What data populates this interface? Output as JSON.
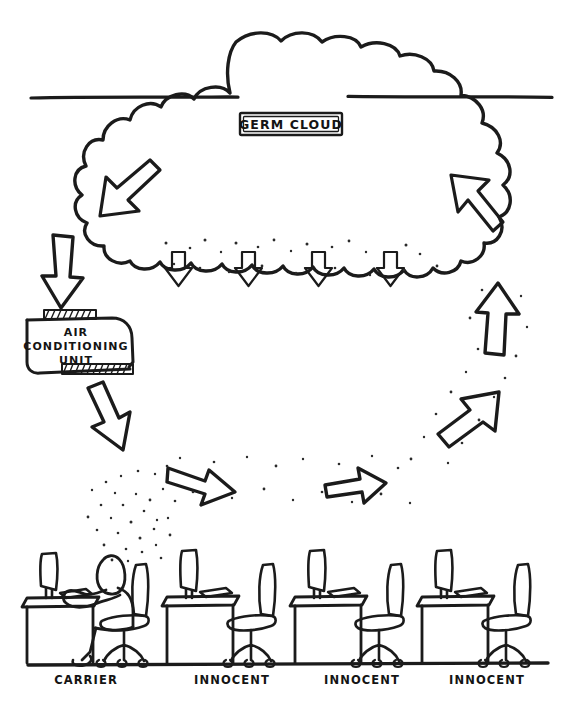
{
  "diagram": {
    "style": "hand-drawn black ink line art on white paper",
    "labels": {
      "cloud": "GERM CLOUD",
      "ac_unit_line1": "AIR",
      "ac_unit_line2": "CONDITIONING",
      "ac_unit_line3": "UNIT"
    },
    "desk_labels": [
      {
        "id": "desk-1",
        "text": "CARRIER",
        "x": 86,
        "occupied": true
      },
      {
        "id": "desk-2",
        "text": "INNOCENT",
        "x": 232,
        "occupied": false
      },
      {
        "id": "desk-3",
        "text": "INNOCENT",
        "x": 362,
        "occupied": false
      },
      {
        "id": "desk-4",
        "text": "INNOCENT",
        "x": 487,
        "occupied": false
      }
    ],
    "flow_arrows": [
      {
        "id": "arrow-cloud-intake-left",
        "direction": "down-left",
        "note": "germs swirling inside cloud"
      },
      {
        "id": "arrow-cloud-to-ac",
        "direction": "down",
        "note": "cloud feeds air conditioning unit"
      },
      {
        "id": "arrow-ac-outflow",
        "direction": "down-right",
        "note": "contaminated air leaves AC unit"
      },
      {
        "id": "arrow-floor-spread-left",
        "direction": "right-down",
        "note": "air travels across the office"
      },
      {
        "id": "arrow-floor-spread-right",
        "direction": "right-up",
        "note": "air reaches far desks"
      },
      {
        "id": "arrow-rise-diagonal",
        "direction": "up-right",
        "note": "air rises on the right side"
      },
      {
        "id": "arrow-rise-vertical",
        "direction": "up",
        "note": "air returns upward"
      },
      {
        "id": "arrow-return-to-cloud",
        "direction": "up-left",
        "note": "air re-enters germ cloud"
      }
    ],
    "fallout_arrows": {
      "count": 4,
      "direction": "down",
      "note": "germs raining out of the cloud"
    },
    "colors": {
      "ink": "#1b1b1b",
      "paper": "#ffffff"
    }
  }
}
